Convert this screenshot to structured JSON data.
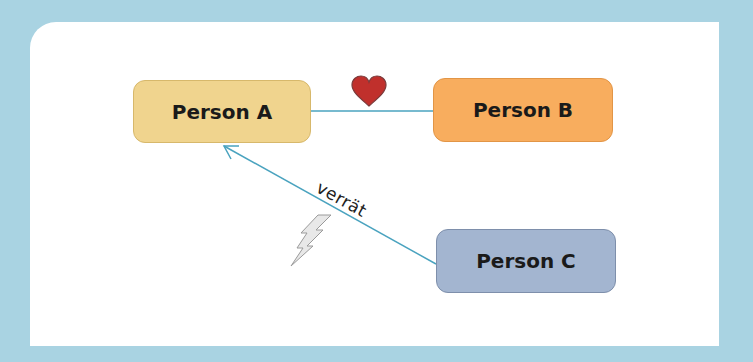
{
  "diagram": {
    "nodes": [
      {
        "id": "a",
        "label": "Person A",
        "color": "#f0d48e"
      },
      {
        "id": "b",
        "label": "Person B",
        "color": "#f8ad5e"
      },
      {
        "id": "c",
        "label": "Person C",
        "color": "#a3b5d0"
      }
    ],
    "edges": [
      {
        "from": "a",
        "to": "b",
        "label": "",
        "icon": "heart-icon",
        "arrow": false
      },
      {
        "from": "c",
        "to": "a",
        "label": "verrät",
        "icon": "lightning-icon",
        "arrow": true
      }
    ],
    "edge_color": "#4aa3bf",
    "background_color": "#a9d3e2",
    "card_color": "#ffffff"
  }
}
